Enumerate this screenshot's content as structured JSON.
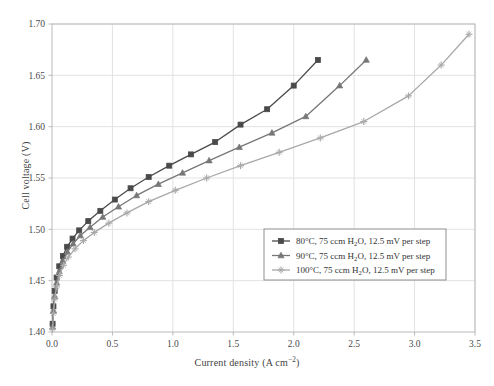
{
  "chart_data": {
    "type": "line",
    "title": "",
    "xlabel": "Current density (A cm⁻²)",
    "ylabel": "Cell voltage (V)",
    "xlim": [
      0.0,
      3.5
    ],
    "ylim": [
      1.4,
      1.7
    ],
    "xticks": [
      "0.0",
      "0.5",
      "1.0",
      "1.5",
      "2.0",
      "2.5",
      "3.0",
      "3.5"
    ],
    "xtick_values": [
      0.0,
      0.5,
      1.0,
      1.5,
      2.0,
      2.5,
      3.0,
      3.5
    ],
    "yticks": [
      "1.40",
      "1.45",
      "1.50",
      "1.55",
      "1.60",
      "1.65",
      "1.70"
    ],
    "ytick_values": [
      1.4,
      1.45,
      1.5,
      1.55,
      1.6,
      1.65,
      1.7
    ],
    "grid": true,
    "legend_position": "lower right",
    "series": [
      {
        "name": "80°C, 75 ccm H2O, 12.5 mV per step",
        "color": "#4a4a4a",
        "marker": "square",
        "x": [
          0.005,
          0.012,
          0.022,
          0.038,
          0.06,
          0.09,
          0.125,
          0.17,
          0.225,
          0.3,
          0.4,
          0.52,
          0.65,
          0.8,
          0.97,
          1.15,
          1.35,
          1.56,
          1.78,
          2.0,
          2.2
        ],
        "y": [
          1.408,
          1.425,
          1.44,
          1.453,
          1.464,
          1.474,
          1.483,
          1.491,
          1.499,
          1.508,
          1.518,
          1.529,
          1.54,
          1.551,
          1.562,
          1.573,
          1.585,
          1.602,
          1.617,
          1.64,
          1.665
        ]
      },
      {
        "name": "90°C, 75 ccm H2O, 12.5 mV per step",
        "color": "#777777",
        "marker": "triangle",
        "x": [
          0.005,
          0.012,
          0.022,
          0.038,
          0.06,
          0.09,
          0.128,
          0.175,
          0.235,
          0.315,
          0.42,
          0.55,
          0.7,
          0.88,
          1.08,
          1.3,
          1.55,
          1.82,
          2.1,
          2.38,
          2.6
        ],
        "y": [
          1.405,
          1.421,
          1.435,
          1.448,
          1.459,
          1.469,
          1.478,
          1.486,
          1.494,
          1.502,
          1.512,
          1.522,
          1.533,
          1.544,
          1.555,
          1.567,
          1.58,
          1.594,
          1.61,
          1.64,
          1.665
        ]
      },
      {
        "name": "100°C, 75 ccm H2O, 12.5 mV per step",
        "color": "#a8a8a8",
        "marker": "plus",
        "x": [
          0.005,
          0.012,
          0.022,
          0.038,
          0.062,
          0.095,
          0.135,
          0.19,
          0.26,
          0.35,
          0.47,
          0.62,
          0.8,
          1.02,
          1.28,
          1.56,
          1.88,
          2.22,
          2.58,
          2.95,
          3.22,
          3.45
        ],
        "y": [
          1.403,
          1.418,
          1.432,
          1.444,
          1.455,
          1.465,
          1.473,
          1.481,
          1.489,
          1.497,
          1.506,
          1.516,
          1.527,
          1.538,
          1.55,
          1.562,
          1.575,
          1.589,
          1.605,
          1.63,
          1.66,
          1.69
        ]
      }
    ]
  },
  "legend": {
    "entries": [
      {
        "temperature": "80°C",
        "flow": "75 ccm H",
        "flow_sub": "2",
        "flow_tail": "O",
        "step": "12.5 mV per step",
        "marker": "square"
      },
      {
        "temperature": "90°C",
        "flow": "75 ccm H",
        "flow_sub": "2",
        "flow_tail": "O",
        "step": "12.5 mV per step",
        "marker": "triangle"
      },
      {
        "temperature": "100°C",
        "flow": "75 ccm H",
        "flow_sub": "2",
        "flow_tail": "O",
        "step": "12.5 mV per step",
        "marker": "plus"
      }
    ]
  },
  "axes": {
    "x_title_main": "Current density (A cm",
    "x_title_sup": "−2",
    "x_title_end": ")",
    "y_title": "Cell voltage (V)"
  },
  "colors": {
    "series_80": "#4a4a4a",
    "series_90": "#777777",
    "series_100": "#a8a8a8",
    "grid": "#e2e2e2",
    "frame": "#b9b9b9",
    "background": "#ffffff"
  }
}
